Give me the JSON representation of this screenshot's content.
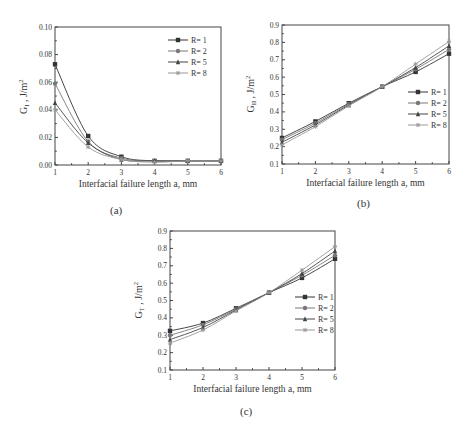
{
  "figure": {
    "captions": [
      "(a)",
      "(b)",
      "(c)"
    ]
  },
  "chart_data": [
    {
      "id": "a",
      "type": "line",
      "title": "",
      "caption": "(a)",
      "xlabel": "Interfacial failure length a, mm",
      "ylabel": "G_I , J/m^2",
      "ylabel_main": "G",
      "ylabel_sub": "I",
      "ylabel_unit": " , J/m",
      "ylabel_sup": "2",
      "x": [
        1,
        2,
        3,
        4,
        5,
        6
      ],
      "xlim": [
        1,
        6
      ],
      "ylim": [
        0.0,
        0.1
      ],
      "xticks": [
        "1",
        "2",
        "3",
        "4",
        "5",
        "6"
      ],
      "yticks": [
        "0.00",
        "0.02",
        "0.04",
        "0.06",
        "0.08",
        "0.10"
      ],
      "grid": false,
      "legend_position": "upper right",
      "series": [
        {
          "name": "R= 1",
          "marker": "square",
          "color": "#333333",
          "values": [
            0.073,
            0.021,
            0.006,
            0.003,
            0.003,
            0.003
          ]
        },
        {
          "name": "R= 2",
          "marker": "circle",
          "color": "#777777",
          "values": [
            0.059,
            0.017,
            0.005,
            0.003,
            0.003,
            0.003
          ]
        },
        {
          "name": "R= 5",
          "marker": "triangle",
          "color": "#444444",
          "values": [
            0.045,
            0.016,
            0.004,
            0.003,
            0.003,
            0.003
          ]
        },
        {
          "name": "R= 8",
          "marker": "star",
          "color": "#999999",
          "values": [
            0.04,
            0.013,
            0.004,
            0.002,
            0.003,
            0.003
          ]
        }
      ]
    },
    {
      "id": "b",
      "type": "line",
      "title": "",
      "caption": "(b)",
      "xlabel": "Interfacial failure length a, mm",
      "ylabel": "G_II , J/m^2",
      "ylabel_main": "G",
      "ylabel_sub": "II",
      "ylabel_unit": " , J/m",
      "ylabel_sup": "2",
      "x": [
        1,
        2,
        3,
        4,
        5,
        6
      ],
      "xlim": [
        1,
        6
      ],
      "ylim": [
        0.1,
        0.9
      ],
      "xticks": [
        "1",
        "2",
        "3",
        "4",
        "5",
        "6"
      ],
      "yticks": [
        "0.1",
        "0.2",
        "0.3",
        "0.4",
        "0.5",
        "0.6",
        "0.7",
        "0.8",
        "0.9"
      ],
      "grid": false,
      "legend_position": "center right",
      "series": [
        {
          "name": "R= 1",
          "marker": "square",
          "color": "#333333",
          "values": [
            0.25,
            0.345,
            0.45,
            0.545,
            0.63,
            0.735
          ]
        },
        {
          "name": "R= 2",
          "marker": "circle",
          "color": "#777777",
          "values": [
            0.24,
            0.335,
            0.445,
            0.545,
            0.645,
            0.76
          ]
        },
        {
          "name": "R= 5",
          "marker": "triangle",
          "color": "#444444",
          "values": [
            0.225,
            0.325,
            0.44,
            0.545,
            0.655,
            0.78
          ]
        },
        {
          "name": "R= 8",
          "marker": "star",
          "color": "#999999",
          "values": [
            0.21,
            0.315,
            0.435,
            0.545,
            0.675,
            0.805
          ]
        }
      ]
    },
    {
      "id": "c",
      "type": "line",
      "title": "",
      "caption": "(c)",
      "xlabel": "Interfacial failure length a, mm",
      "ylabel": "G_T , J/m^2",
      "ylabel_main": "G",
      "ylabel_sub": "T",
      "ylabel_unit": " , J/m",
      "ylabel_sup": "2",
      "x": [
        1,
        2,
        3,
        4,
        5,
        6
      ],
      "xlim": [
        1,
        6
      ],
      "ylim": [
        0.1,
        0.9
      ],
      "xticks": [
        "1",
        "2",
        "3",
        "4",
        "5",
        "6"
      ],
      "yticks": [
        "0.1",
        "0.2",
        "0.3",
        "0.4",
        "0.5",
        "0.6",
        "0.7",
        "0.8",
        "0.9"
      ],
      "grid": false,
      "legend_position": "center right",
      "series": [
        {
          "name": "R= 1",
          "marker": "square",
          "color": "#333333",
          "values": [
            0.325,
            0.37,
            0.455,
            0.545,
            0.63,
            0.74
          ]
        },
        {
          "name": "R= 2",
          "marker": "circle",
          "color": "#777777",
          "values": [
            0.3,
            0.36,
            0.45,
            0.545,
            0.645,
            0.76
          ]
        },
        {
          "name": "R= 5",
          "marker": "triangle",
          "color": "#444444",
          "values": [
            0.275,
            0.345,
            0.445,
            0.545,
            0.655,
            0.785
          ]
        },
        {
          "name": "R= 8",
          "marker": "star",
          "color": "#999999",
          "values": [
            0.255,
            0.33,
            0.44,
            0.545,
            0.675,
            0.81
          ]
        }
      ]
    }
  ]
}
